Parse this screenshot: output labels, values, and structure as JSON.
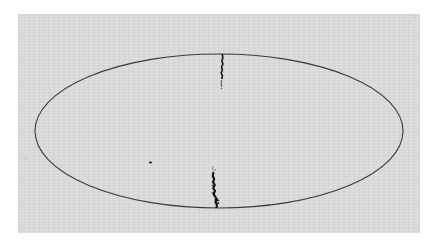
{
  "figure": {
    "colors": {
      "page_background": "#ffffff",
      "panel_background": "#dcdcdc",
      "outline": "#3a3a3a",
      "feature": "#111111"
    },
    "ellipse": {
      "cx": 219,
      "cy": 131,
      "rx": 184,
      "ry": 77
    },
    "features": [
      {
        "name": "northern-filament",
        "label": ""
      },
      {
        "name": "southern-filament",
        "label": ""
      },
      {
        "name": "isolated-source",
        "label": ""
      }
    ]
  }
}
